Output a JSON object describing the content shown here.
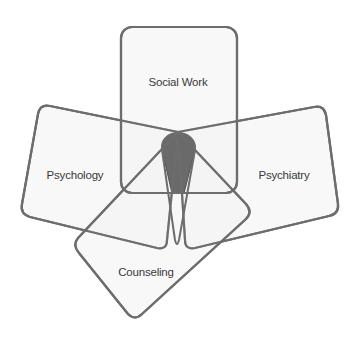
{
  "diagram": {
    "type": "overlapping-areas",
    "center_label": "",
    "colors": {
      "box_fill": "#f2f2f2",
      "box_stroke": "#6d6d6d",
      "overlap_fill": "#6a6a6a",
      "background": "#ffffff"
    },
    "areas": [
      {
        "id": "social-work",
        "label": "Social Work"
      },
      {
        "id": "psychology",
        "label": "Psychology"
      },
      {
        "id": "psychiatry",
        "label": "Psychiatry"
      },
      {
        "id": "counseling",
        "label": "Counseling"
      }
    ]
  }
}
